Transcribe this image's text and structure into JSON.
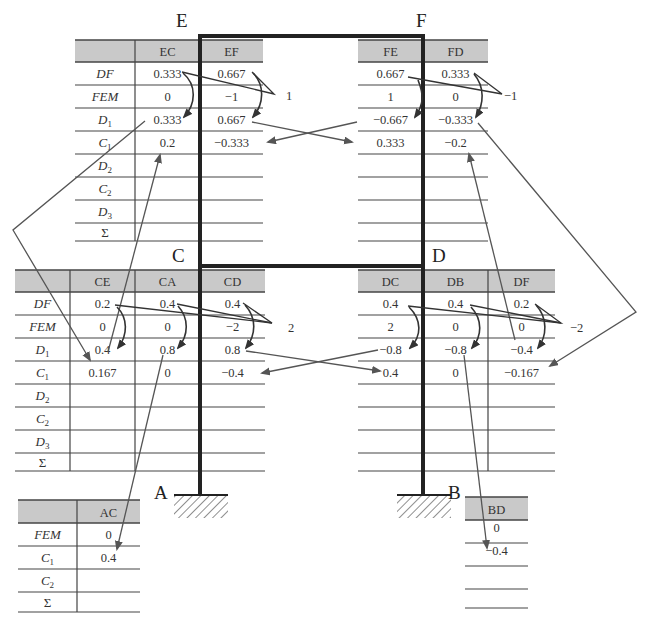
{
  "nodes": {
    "E": "E",
    "F": "F",
    "C": "C",
    "D": "D",
    "A": "A",
    "B": "B"
  },
  "row_labels_full": [
    "DF",
    "FEM",
    "D1",
    "C1",
    "D2",
    "C2",
    "D3",
    "Σ"
  ],
  "row_labels_support": [
    "FEM",
    "C1",
    "C2",
    "Σ"
  ],
  "colors": {
    "header_fill": "#c9c9c9",
    "frame": "#222222",
    "grid": "#444444",
    "arrow": "#555555"
  },
  "joint_E": {
    "columns": [
      {
        "header": "EC",
        "values": [
          "0.333",
          "0",
          "0.333",
          "0.2",
          "",
          "",
          "",
          ""
        ]
      },
      {
        "header": "EF",
        "values": [
          "0.667",
          "−1",
          "0.667",
          "−0.333",
          "",
          "",
          "",
          ""
        ]
      }
    ],
    "unbalanced_moment": "1"
  },
  "joint_F": {
    "columns": [
      {
        "header": "FE",
        "values": [
          "0.667",
          "1",
          "−0.667",
          "0.333",
          "",
          "",
          "",
          ""
        ]
      },
      {
        "header": "FD",
        "values": [
          "0.333",
          "0",
          "−0.333",
          "−0.2",
          "",
          "",
          "",
          ""
        ]
      }
    ],
    "unbalanced_moment": "−1"
  },
  "joint_C": {
    "columns": [
      {
        "header": "CE",
        "values": [
          "0.2",
          "0",
          "0.4",
          "0.167",
          "",
          "",
          "",
          ""
        ]
      },
      {
        "header": "CA",
        "values": [
          "0.4",
          "0",
          "0.8",
          "0",
          "",
          "",
          "",
          ""
        ]
      },
      {
        "header": "CD",
        "values": [
          "0.4",
          "−2",
          "0.8",
          "−0.4",
          "",
          "",
          "",
          ""
        ]
      }
    ],
    "unbalanced_moment": "2"
  },
  "joint_D": {
    "columns": [
      {
        "header": "DC",
        "values": [
          "0.4",
          "2",
          "−0.8",
          "0.4",
          "",
          "",
          "",
          ""
        ]
      },
      {
        "header": "DB",
        "values": [
          "0.4",
          "0",
          "−0.8",
          "0",
          "",
          "",
          "",
          ""
        ]
      },
      {
        "header": "DF",
        "values": [
          "0.2",
          "0",
          "−0.4",
          "−0.167",
          "",
          "",
          "",
          ""
        ]
      }
    ],
    "unbalanced_moment": "−2"
  },
  "support_A": {
    "header": "AC",
    "values": [
      "0",
      "0.4",
      "",
      ""
    ]
  },
  "support_B": {
    "header": "BD",
    "values": [
      "0",
      "−0.4",
      "",
      ""
    ]
  }
}
